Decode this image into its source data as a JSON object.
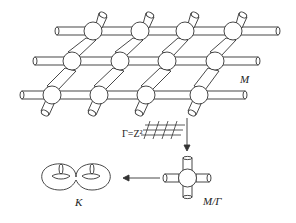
{
  "figure": {
    "labels": {
      "lattice": "M",
      "group": "Γ=Z²",
      "quotient": "M/Γ",
      "surface": "K"
    },
    "lattice": {
      "rows": [
        {
          "y": 31,
          "nodes_x": [
            93,
            140,
            185,
            233
          ],
          "rod_start_x": 55,
          "rod_end_x": 278
        },
        {
          "y": 61,
          "nodes_x": [
            72,
            120,
            167,
            215
          ],
          "rod_start_x": 33,
          "rod_end_x": 258
        },
        {
          "y": 95,
          "nodes_x": [
            52,
            99,
            146,
            199
          ],
          "rod_start_x": 20,
          "rod_end_x": 245
        }
      ],
      "node_radius": 9
    },
    "colors": {
      "stroke": "#333333",
      "background": "#ffffff",
      "fill": "#ffffff"
    }
  }
}
